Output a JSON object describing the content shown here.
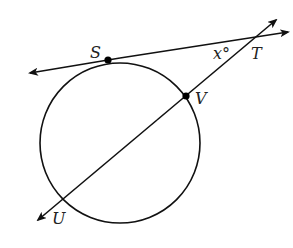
{
  "diagram": {
    "type": "geometry",
    "circle": {
      "cx": 120,
      "cy": 143,
      "r": 80
    },
    "tangent_line": {
      "x1": 30,
      "y1": 74,
      "x2": 288,
      "y2": 32
    },
    "secant_line": {
      "x1": 38,
      "y1": 220,
      "x2": 276,
      "y2": 20
    },
    "points": {
      "S": {
        "label": "S",
        "x": 108,
        "y": 60,
        "dot": true
      },
      "V": {
        "label": "V",
        "x": 186,
        "y": 96,
        "dot": true
      },
      "T": {
        "label": "T",
        "x": 262,
        "y": 36,
        "dot": false
      },
      "U": {
        "label": "U",
        "x": 47,
        "y": 212,
        "dot": false
      }
    },
    "labels": {
      "S": "S",
      "T": "T",
      "V": "V",
      "U": "U",
      "angle": "x°"
    },
    "colors": {
      "stroke": "#111111",
      "background": "#ffffff",
      "text": "#222222"
    }
  }
}
